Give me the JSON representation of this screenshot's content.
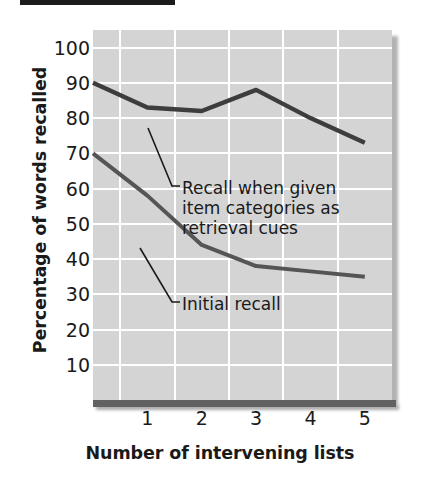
{
  "chart_data": {
    "type": "line",
    "title": "",
    "xlabel": "Number of intervening lists",
    "ylabel": "Percentage of words recalled",
    "x": [
      0,
      1,
      2,
      3,
      4,
      5
    ],
    "categories": [
      "1",
      "2",
      "3",
      "4",
      "5"
    ],
    "xlim": [
      0,
      5.5
    ],
    "ylim": [
      0,
      105
    ],
    "yticks": [
      100,
      90,
      80,
      70,
      60,
      50,
      40,
      30,
      20,
      10
    ],
    "ytick_labels": [
      "100",
      "90",
      "80",
      "70",
      "60",
      "50",
      "40",
      "30",
      "20",
      "10"
    ],
    "xticks": [
      1,
      2,
      3,
      4,
      5
    ],
    "xtick_labels": [
      "1",
      "2",
      "3",
      "4",
      "5"
    ],
    "grid": true,
    "grid_color": "#ffffff",
    "plot_background": "#d4d4d4",
    "legend": "annotations",
    "series": [
      {
        "name": "Recall when given item categories as retrieval cues",
        "color": "#3d3d3d",
        "x": [
          0,
          1,
          2,
          3,
          4,
          5
        ],
        "values": [
          90,
          83,
          82,
          88,
          80,
          73
        ]
      },
      {
        "name": "Initial recall",
        "color": "#555555",
        "x": [
          0,
          1,
          2,
          3,
          4,
          5
        ],
        "values": [
          70,
          58,
          44,
          38,
          36.5,
          35
        ]
      }
    ],
    "annotations": [
      {
        "id": "cued-recall-annotation",
        "text": "Recall when given\nitem categories as\nretrieval cues",
        "points_to_series": "Recall when given item categories as retrieval cues"
      },
      {
        "id": "initial-recall-annotation",
        "text": "Initial recall",
        "points_to_series": "Initial recall"
      }
    ]
  },
  "axes": {
    "y_title": "Percentage of words recalled",
    "x_title": "Number of intervening lists",
    "y_ticks": [
      "100",
      "90",
      "80",
      "70",
      "60",
      "50",
      "40",
      "30",
      "20",
      "10"
    ],
    "x_ticks": [
      "1",
      "2",
      "3",
      "4",
      "5"
    ]
  },
  "annotations": {
    "cued": "Recall when given\nitem categories as\nretrieval cues",
    "initial": "Initial recall"
  },
  "colors": {
    "plot_background": "#d4d4d4",
    "gridline": "#ffffff",
    "line_upper": "#3d3d3d",
    "line_lower": "#555555",
    "text": "#1a1a1a",
    "axis_bar": "#616161"
  }
}
